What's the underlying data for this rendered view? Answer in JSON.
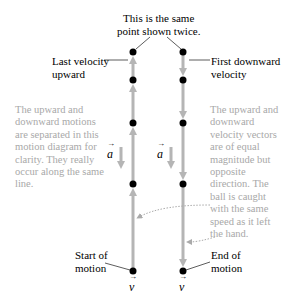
{
  "title": {
    "line1": "This is the same",
    "line2": "point shown twice."
  },
  "labels": {
    "last_velocity_up_1": "Last velocity",
    "last_velocity_up_2": "upward",
    "first_down_1": "First downward",
    "first_down_2": "velocity",
    "start_1": "Start of",
    "start_2": "motion",
    "end_1": "End of",
    "end_2": "motion"
  },
  "notes": {
    "left": [
      "The upward and",
      "downward motions",
      "are separated in this",
      "motion diagram for",
      "clarity. They really",
      "occur along the same",
      "line."
    ],
    "right": [
      "The upward and",
      "downward",
      "velocity vectors",
      "are of equal",
      "magnitude but",
      "opposite",
      "direction. The",
      "ball is caught",
      "with the same",
      "speed as it left",
      "the hand."
    ]
  },
  "symbols": {
    "acceleration": "a",
    "velocity": "v"
  },
  "colors": {
    "vector": "#b5b5b5",
    "dot": "#000000",
    "note_text": "#a8a8a8",
    "leader": "#333333"
  },
  "diagram": {
    "upward_column_x": 133,
    "downward_column_x": 183,
    "dot_y": [
      52,
      80,
      123,
      184,
      271
    ]
  }
}
